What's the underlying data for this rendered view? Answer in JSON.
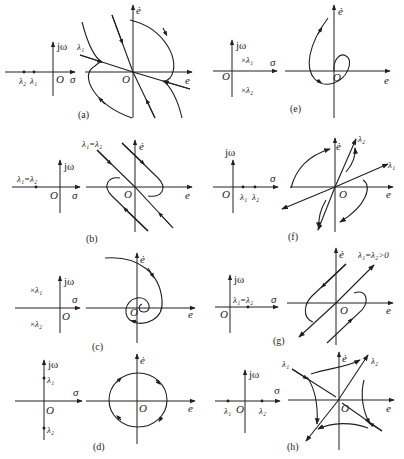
{
  "figure": {
    "axis_labels": {
      "s_plane_vertical": "jω",
      "s_plane_horizontal": "σ",
      "origin": "O",
      "phase_vertical": "ė",
      "phase_horizontal": "e"
    },
    "panels": [
      {
        "id": "a",
        "caption": "(a)",
        "eigen_label": "λ₂ λ₁",
        "eigenvalues": "two distinct negative real",
        "portrait": "stable node",
        "line_label": "λ₁"
      },
      {
        "id": "b",
        "caption": "(b)",
        "eigen_label": "λ₁=λ₂",
        "eigenvalues": "repeated negative real",
        "portrait": "stable degenerate node",
        "line_label": "λ₁=λ₂"
      },
      {
        "id": "c",
        "caption": "(c)",
        "eigen_label": "λ₁, λ₂",
        "eigenvalues": "complex conjugate, negative real part",
        "portrait": "stable focus"
      },
      {
        "id": "d",
        "caption": "(d)",
        "eigen_label": "λ₁, λ₂",
        "eigenvalues": "purely imaginary",
        "portrait": "center"
      },
      {
        "id": "e",
        "caption": "(e)",
        "eigen_label": "λ₁, λ₂",
        "eigenvalues": "complex conjugate, positive real part",
        "portrait": "unstable focus"
      },
      {
        "id": "f",
        "caption": "(f)",
        "eigen_label": "λ₁ λ₂",
        "eigenvalues": "two distinct positive real",
        "portrait": "unstable node",
        "line_labels": [
          "λ₂",
          "λ₁"
        ]
      },
      {
        "id": "g",
        "caption": "(g)",
        "eigen_label": "λ₁=λ₂",
        "eigenvalues": "repeated positive real",
        "portrait": "unstable degenerate node",
        "line_label": "λ₁=λ₂>0"
      },
      {
        "id": "h",
        "caption": "(h)",
        "eigen_label": "λ₁ O λ₂",
        "eigenvalues": "one negative, one positive real",
        "portrait": "saddle point",
        "line_labels": [
          "λ₁",
          "λ₂"
        ]
      }
    ]
  },
  "text": {
    "jw": "jω",
    "sigma": "σ",
    "O": "O",
    "edot": "ė",
    "e": "e",
    "l1": "λ",
    "l2": "λ",
    "sub1": "1",
    "sub2": "2",
    "eq_l1l2": "λ₁=λ₂",
    "eq_gt0": "λ₁=λ₂>0",
    "cap_a": "(a)",
    "cap_b": "(b)",
    "cap_c": "(c)",
    "cap_d": "(d)",
    "cap_e": "(e)",
    "cap_f": "(f)",
    "cap_g": "(g)",
    "cap_h": "(h)",
    "lambda1": "λ₁",
    "lambda2": "λ₂"
  }
}
